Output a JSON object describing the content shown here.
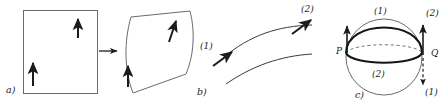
{
  "figure": {
    "name": "parallel-transport-figure",
    "background": "#ffffff",
    "ink": "#1b1b1b",
    "width": 448,
    "height": 109
  },
  "panels": [
    {
      "id": "a",
      "label": "a)",
      "label_x": 6,
      "label_y": 90,
      "description": "rectangle with two upward vectors mapped by an arrow to a sheared curved patch with two vectors"
    },
    {
      "id": "b",
      "label": "b)",
      "label_x": 197,
      "label_y": 92,
      "description": "two curves, upper curve carries tangent vectors labelled (1) and (2)"
    },
    {
      "id": "c",
      "label": "c)",
      "label_x": 355,
      "label_y": 95,
      "description": "sphere with two great-circle paths between points P and Q and transported vectors"
    }
  ],
  "panel_a": {
    "source_shape": "rectangle",
    "target_shape": "curved-patch",
    "map_arrow": "right-arrow",
    "vectors": [
      {
        "name": "rect-vector-upper-right",
        "direction": "up"
      },
      {
        "name": "rect-vector-lower-left",
        "direction": "up"
      },
      {
        "name": "patch-vector-upper-right",
        "direction": "up-right-tilted"
      },
      {
        "name": "patch-vector-lower-left",
        "direction": "up"
      }
    ]
  },
  "panel_b": {
    "curves": [
      {
        "name": "upper-curve"
      },
      {
        "name": "lower-curve"
      }
    ],
    "vectors": [
      {
        "name": "vector-1",
        "label": "(1)",
        "label_x": 200,
        "label_y": 47
      },
      {
        "name": "vector-2",
        "label": "(2)",
        "label_x": 301,
        "label_y": 10
      }
    ]
  },
  "panel_c": {
    "points": [
      {
        "name": "point-p",
        "label": "P",
        "label_x": 337,
        "label_y": 52
      },
      {
        "name": "point-q",
        "label": "Q",
        "label_x": 432,
        "label_y": 54
      }
    ],
    "paths": [
      {
        "name": "path-1-upper",
        "label": "(1)",
        "label_x": 374,
        "label_y": 12
      },
      {
        "name": "path-2-equatorial",
        "label": "(2)",
        "label_x": 372,
        "label_y": 76
      }
    ],
    "vectors": [
      {
        "name": "vector-at-p",
        "label": "",
        "direction": "up"
      },
      {
        "name": "vector-q-along-1",
        "label": "(1)",
        "label_x": 427,
        "label_y": 94,
        "direction": "down-dashed"
      },
      {
        "name": "vector-q-along-2",
        "label": "(2)",
        "label_x": 426,
        "label_y": 14,
        "direction": "up"
      }
    ]
  }
}
